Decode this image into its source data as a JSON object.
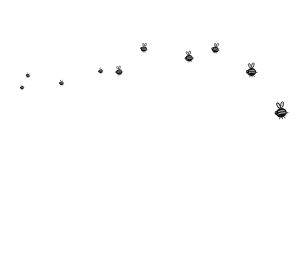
{
  "scene": {
    "description": "A swarm of small black cartoon bees flying in a rising arc from left to right across a white background, growing larger toward the right.",
    "background": "#ffffff",
    "ink": "#111111"
  },
  "bees": [
    {
      "x": 22,
      "y": 87,
      "size": 6,
      "rot": -10,
      "wings": false
    },
    {
      "x": 28,
      "y": 75,
      "size": 6,
      "rot": 10,
      "wings": false
    },
    {
      "x": 61,
      "y": 82,
      "size": 7,
      "rot": -5,
      "wings": false
    },
    {
      "x": 100,
      "y": 70,
      "size": 7,
      "rot": -15,
      "wings": false
    },
    {
      "x": 119,
      "y": 71,
      "size": 10,
      "rot": -10,
      "wings": true
    },
    {
      "x": 144,
      "y": 48,
      "size": 10,
      "rot": 5,
      "wings": true
    },
    {
      "x": 189,
      "y": 57,
      "size": 12,
      "rot": -10,
      "wings": true
    },
    {
      "x": 215,
      "y": 48,
      "size": 11,
      "rot": 10,
      "wings": true
    },
    {
      "x": 251,
      "y": 70,
      "size": 15,
      "rot": -5,
      "wings": true
    },
    {
      "x": 281,
      "y": 111,
      "size": 18,
      "rot": -10,
      "wings": true
    }
  ]
}
